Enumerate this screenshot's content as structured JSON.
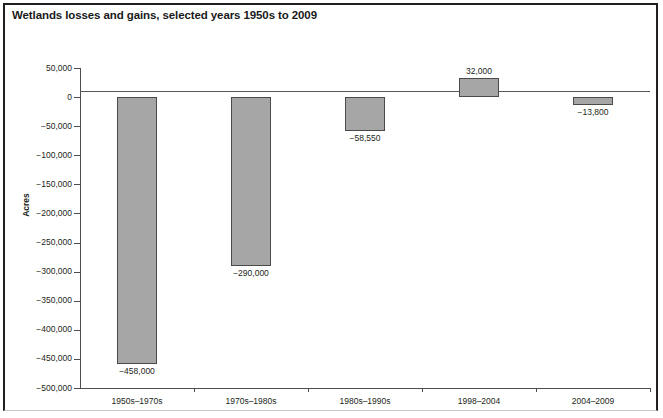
{
  "figure": {
    "title": "Wetlands losses and gains, selected years 1950s to 2009"
  },
  "chart_data": {
    "type": "bar",
    "title": "Wetlands losses and gains, selected years 1950s to 2009",
    "xlabel": "",
    "ylabel": "Acres",
    "categories": [
      "1950s–1970s",
      "1970s–1980s",
      "1980s–1990s",
      "1998–2004",
      "2004–2009"
    ],
    "values": [
      -458000,
      -290000,
      -58550,
      32000,
      -13800
    ],
    "value_labels": [
      "−458,000",
      "−290,000",
      "−58,550",
      "32,000",
      "−13,800"
    ],
    "ylim": [
      -500000,
      50000
    ],
    "ytick_values": [
      50000,
      0,
      -50000,
      -100000,
      -150000,
      -200000,
      -250000,
      -300000,
      -350000,
      -400000,
      -450000,
      -500000
    ],
    "ytick_labels": [
      "50,000",
      "0",
      "−50,000",
      "−100,000",
      "−150,000",
      "−200,000",
      "−250,000",
      "−300,000",
      "−350,000",
      "−400,000",
      "−450,000",
      "−500,000"
    ],
    "grid": false,
    "legend": null,
    "bar_fill_color": "#a6a6a6",
    "bar_border_color": "#4a4a4a",
    "axis_color": "#4d4d4d",
    "zero_line_value": 0
  }
}
